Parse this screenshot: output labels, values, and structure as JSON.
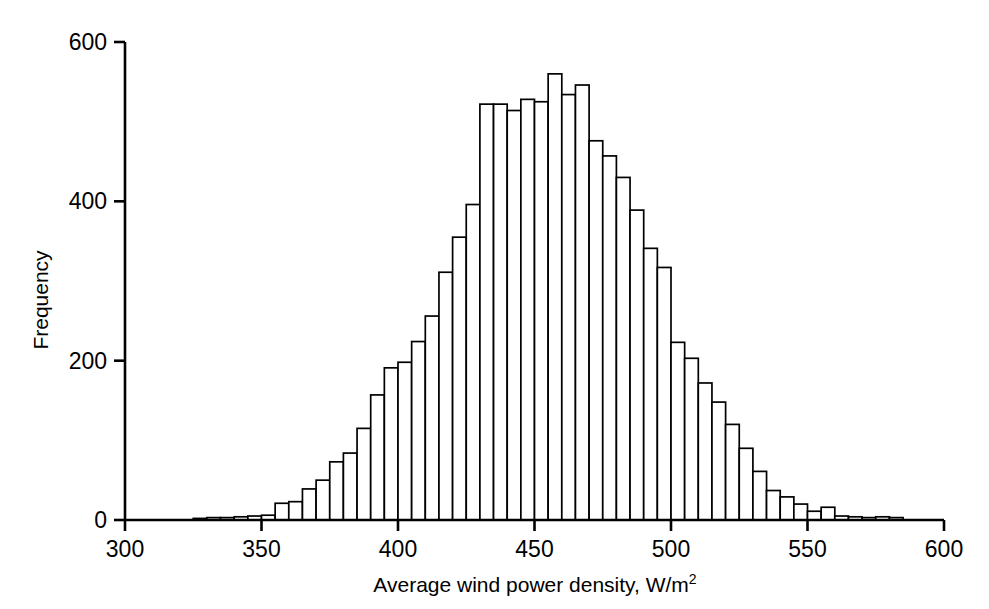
{
  "chart_data": {
    "type": "bar",
    "title": "",
    "subtitle": "",
    "xlabel": "Average wind power density, W/m²",
    "ylabel": "Frequency",
    "xlim": [
      300,
      600
    ],
    "ylim": [
      0,
      600
    ],
    "xticks": [
      300,
      350,
      400,
      450,
      500,
      550,
      600
    ],
    "xtick_labels": [
      "300",
      "350",
      "400",
      "450",
      "500",
      "550",
      "600"
    ],
    "yticks": [
      0,
      200,
      400,
      600
    ],
    "ytick_labels": [
      "0",
      "200",
      "400",
      "600"
    ],
    "grid": false,
    "legend": null,
    "bin_width": 5,
    "bin_starts": [
      325,
      330,
      335,
      340,
      345,
      350,
      355,
      360,
      365,
      370,
      375,
      380,
      385,
      390,
      395,
      400,
      405,
      410,
      415,
      420,
      425,
      430,
      435,
      440,
      445,
      450,
      455,
      460,
      465,
      470,
      475,
      480,
      485,
      490,
      495,
      500,
      505,
      510,
      515,
      520,
      525,
      530,
      535,
      540,
      545,
      550,
      555,
      560,
      565,
      570,
      575,
      580
    ],
    "categories": [
      "325",
      "330",
      "335",
      "340",
      "345",
      "350",
      "355",
      "360",
      "365",
      "370",
      "375",
      "380",
      "385",
      "390",
      "395",
      "400",
      "405",
      "410",
      "415",
      "420",
      "425",
      "430",
      "435",
      "440",
      "445",
      "450",
      "455",
      "460",
      "465",
      "470",
      "475",
      "480",
      "485",
      "490",
      "495",
      "500",
      "505",
      "510",
      "515",
      "520",
      "525",
      "530",
      "535",
      "540",
      "545",
      "550",
      "555",
      "560",
      "565",
      "570",
      "575",
      "580"
    ],
    "values": [
      2,
      3,
      3,
      4,
      5,
      6,
      21,
      23,
      39,
      50,
      73,
      84,
      115,
      157,
      191,
      198,
      224,
      256,
      311,
      355,
      396,
      522,
      522,
      514,
      528,
      525,
      560,
      534,
      546,
      476,
      457,
      430,
      389,
      341,
      317,
      223,
      203,
      172,
      148,
      120,
      90,
      61,
      37,
      29,
      20,
      11,
      16,
      5,
      4,
      3,
      4,
      3
    ],
    "series": [
      {
        "name": "Frequency",
        "values": [
          2,
          3,
          3,
          4,
          5,
          6,
          21,
          23,
          39,
          50,
          73,
          84,
          115,
          157,
          191,
          198,
          224,
          256,
          311,
          355,
          396,
          522,
          522,
          514,
          528,
          525,
          560,
          534,
          546,
          476,
          457,
          430,
          389,
          341,
          317,
          223,
          203,
          172,
          148,
          120,
          90,
          61,
          37,
          29,
          20,
          11,
          16,
          5,
          4,
          3,
          4,
          3
        ]
      }
    ],
    "bar_edge_color": "#000000",
    "bar_fill_color": "#ffffff",
    "axis_color": "#000000"
  },
  "axes": {
    "x_title": "Average wind power density, W/m",
    "x_title_superscript": "2",
    "y_title": "Frequency"
  }
}
